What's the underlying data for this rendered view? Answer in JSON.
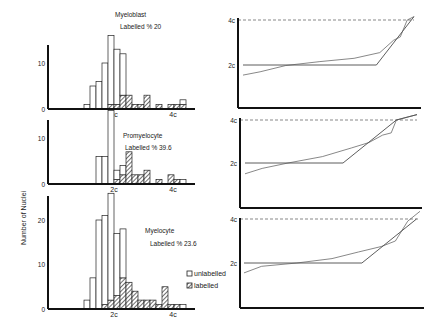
{
  "figure": {
    "y_axis_label": "Number of Nuclei",
    "legend": {
      "unlabelled": "unlabelled",
      "labelled": "labelled"
    },
    "colors": {
      "ink": "#111111",
      "background": "#ffffff",
      "dashed": "#555555",
      "curve": "#444444"
    }
  },
  "chart_data": [
    {
      "type": "bar",
      "panel": "left-top",
      "title": "Myeloblast",
      "subtitle": "Labelled % 20",
      "xlabel": "",
      "ylabel": "Number of Nuclei",
      "x_tick_labels": [
        "2c",
        "4c"
      ],
      "y_tick_labels": [
        "0",
        "10"
      ],
      "ylim": [
        0,
        15
      ],
      "stacked": true,
      "bins": 18,
      "series": [
        {
          "name": "unlabelled",
          "values": [
            1,
            5,
            6,
            10,
            15,
            12,
            9,
            0,
            0,
            0,
            0,
            0,
            0,
            0,
            0,
            0,
            1,
            0
          ]
        },
        {
          "name": "labelled",
          "values": [
            0,
            0,
            0,
            0,
            1,
            1,
            3,
            3,
            1,
            1,
            3,
            0,
            1,
            0,
            1,
            1,
            1,
            0
          ]
        }
      ]
    },
    {
      "type": "bar",
      "panel": "left-middle",
      "title": "Promyelocyte",
      "subtitle": "Labelled % 39.6",
      "x_tick_labels": [
        "2c",
        "4c"
      ],
      "y_tick_labels": [
        "0",
        "10"
      ],
      "ylim": [
        0,
        15
      ],
      "stacked": true,
      "bins": 18,
      "series": [
        {
          "name": "unlabelled",
          "values": [
            0,
            0,
            6,
            6,
            16,
            2,
            2,
            0,
            0,
            0,
            0,
            0,
            0,
            0,
            0,
            0,
            1,
            0
          ]
        },
        {
          "name": "labelled",
          "values": [
            0,
            0,
            0,
            0,
            0,
            1,
            2,
            7,
            2,
            2,
            3,
            0,
            1,
            0,
            2,
            1,
            0,
            0
          ]
        }
      ]
    },
    {
      "type": "bar",
      "panel": "left-bottom",
      "title": "Myelocyte",
      "subtitle": "Labelled % 23.6",
      "x_tick_labels": [
        "2c",
        "4c"
      ],
      "y_tick_labels": [
        "0",
        "10",
        "20"
      ],
      "ylim": [
        0,
        25
      ],
      "stacked": true,
      "bins": 18,
      "series": [
        {
          "name": "unlabelled",
          "values": [
            2,
            7,
            20,
            20,
            24,
            14,
            11,
            0,
            0,
            0,
            0,
            0,
            0,
            0,
            0,
            0,
            1,
            0
          ]
        },
        {
          "name": "labelled",
          "values": [
            0,
            0,
            0,
            1,
            2,
            3,
            7,
            6,
            4,
            2,
            2,
            2,
            1,
            5,
            1,
            1,
            0,
            0
          ]
        }
      ]
    },
    {
      "type": "line",
      "panel": "right-top",
      "title": "",
      "y_tick_labels": [
        "2c",
        "4c"
      ],
      "reference_line": "4c (dashed)",
      "series": [
        {
          "name": "model",
          "points": [
            [
              0,
              2.0
            ],
            [
              0.78,
              2.0
            ],
            [
              1.0,
              4.15
            ]
          ]
        },
        {
          "name": "observed",
          "points": [
            [
              0,
              1.55
            ],
            [
              0.1,
              1.7
            ],
            [
              0.25,
              1.98
            ],
            [
              0.45,
              2.15
            ],
            [
              0.65,
              2.3
            ],
            [
              0.8,
              2.55
            ],
            [
              0.88,
              3.1
            ],
            [
              0.92,
              3.25
            ],
            [
              0.96,
              4.0
            ],
            [
              1.0,
              4.15
            ]
          ]
        }
      ]
    },
    {
      "type": "line",
      "panel": "right-middle",
      "y_tick_labels": [
        "2c",
        "4c"
      ],
      "reference_line": "4c (dashed)",
      "series": [
        {
          "name": "model",
          "points": [
            [
              0,
              2.0
            ],
            [
              0.57,
              2.0
            ],
            [
              0.88,
              4.0
            ],
            [
              1.0,
              4.25
            ]
          ]
        },
        {
          "name": "observed",
          "points": [
            [
              0,
              1.5
            ],
            [
              0.1,
              1.75
            ],
            [
              0.25,
              2.0
            ],
            [
              0.45,
              2.3
            ],
            [
              0.62,
              2.7
            ],
            [
              0.72,
              2.95
            ],
            [
              0.8,
              3.3
            ],
            [
              0.85,
              3.4
            ],
            [
              0.88,
              4.0
            ],
            [
              1.0,
              4.25
            ]
          ]
        }
      ]
    },
    {
      "type": "line",
      "panel": "right-bottom",
      "y_tick_labels": [
        "2c",
        "4c"
      ],
      "reference_line": "4c (dashed)",
      "series": [
        {
          "name": "model",
          "points": [
            [
              0,
              2.0
            ],
            [
              0.67,
              2.0
            ],
            [
              0.98,
              4.0
            ]
          ]
        },
        {
          "name": "observed",
          "points": [
            [
              0,
              1.55
            ],
            [
              0.1,
              1.85
            ],
            [
              0.3,
              2.0
            ],
            [
              0.5,
              2.2
            ],
            [
              0.65,
              2.5
            ],
            [
              0.78,
              2.75
            ],
            [
              0.86,
              3.0
            ],
            [
              0.93,
              3.9
            ],
            [
              1.0,
              4.35
            ]
          ]
        }
      ]
    }
  ]
}
